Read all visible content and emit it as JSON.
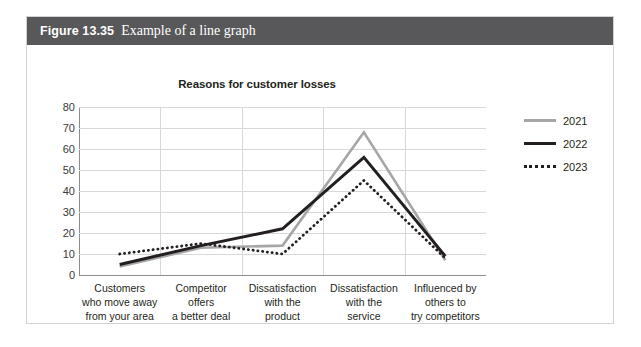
{
  "figure": {
    "number": "Figure 13.35",
    "caption": "Example of a line graph",
    "header_color": "#58585a"
  },
  "chart_data": {
    "type": "line",
    "title": "Reasons for customer losses",
    "xlabel": "",
    "ylabel": "",
    "ylim": [
      0,
      80
    ],
    "yticks": [
      0,
      10,
      20,
      30,
      40,
      50,
      60,
      70,
      80
    ],
    "grid": true,
    "legend_position": "right",
    "categories": [
      "Customers who move away from your area",
      "Competitor offers a better deal",
      "Dissatisfaction with the product",
      "Dissatisfaction with the service",
      "Influenced by others to try competitors"
    ],
    "category_lines": [
      [
        "Customers",
        "who move away",
        "from your area"
      ],
      [
        "Competitor",
        "offers",
        "a better deal"
      ],
      [
        "Dissatisfaction",
        "with the",
        "product"
      ],
      [
        "Dissatisfaction",
        "with the",
        "service"
      ],
      [
        "Influenced by",
        "others to",
        "try competitors"
      ]
    ],
    "series": [
      {
        "name": "2021",
        "values": [
          4,
          13,
          14,
          68,
          7
        ],
        "color": "#a6a6a6",
        "style": "solid",
        "width": 2.6
      },
      {
        "name": "2022",
        "values": [
          5,
          14,
          22,
          56,
          9
        ],
        "color": "#231f20",
        "style": "solid",
        "width": 3.0
      },
      {
        "name": "2023",
        "values": [
          10,
          15,
          10,
          45,
          8
        ],
        "color": "#231f20",
        "style": "dotted",
        "width": 2.8
      }
    ]
  }
}
